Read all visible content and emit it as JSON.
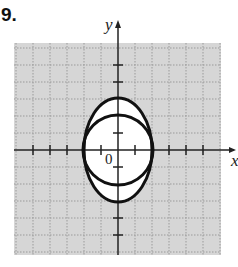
{
  "problem": {
    "number": "9."
  },
  "graph": {
    "x_axis_label": "x",
    "y_axis_label": "y",
    "origin_label": "0",
    "grid": {
      "x_min": -6,
      "x_max": 6,
      "y_min": -6,
      "y_max": 6,
      "unit_px": 17
    },
    "colors": {
      "grid_bg": "#d6d6d6",
      "grid_lines": "#9a9a9a",
      "curve": "#111111",
      "axes": "#222222"
    },
    "curves": [
      {
        "type": "ellipse",
        "center": [
          0,
          0
        ],
        "rx": 2,
        "ry": 3
      },
      {
        "type": "circle",
        "center": [
          0,
          0
        ],
        "r": 2
      }
    ]
  }
}
